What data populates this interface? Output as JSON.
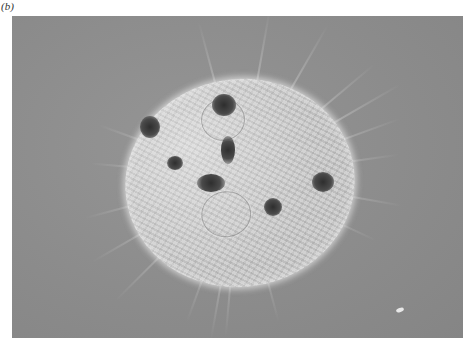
{
  "figure": {
    "panel_label": "(b)",
    "colors": {
      "background_gray": "#8c8c8c",
      "cell_body": "#c9c9c9",
      "nucleus": "#2e2e2e",
      "page": "#ffffff"
    },
    "nuclei_count": 7
  }
}
